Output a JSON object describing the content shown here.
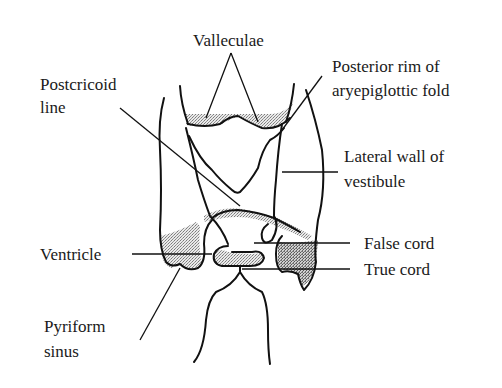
{
  "figure": {
    "labels": {
      "valleculae": "Valleculae",
      "postcricoid_line_1": "Postcricoid",
      "postcricoid_line_2": "line",
      "posterior_rim_1": "Posterior rim of",
      "posterior_rim_2": "aryepiglottic fold",
      "lateral_wall_1": "Lateral wall of",
      "lateral_wall_2": "vestibule",
      "false_cord": "False cord",
      "true_cord": "True cord",
      "ventricle": "Ventricle",
      "pyriform_1": "Pyriform",
      "pyriform_2": "sinus"
    }
  }
}
